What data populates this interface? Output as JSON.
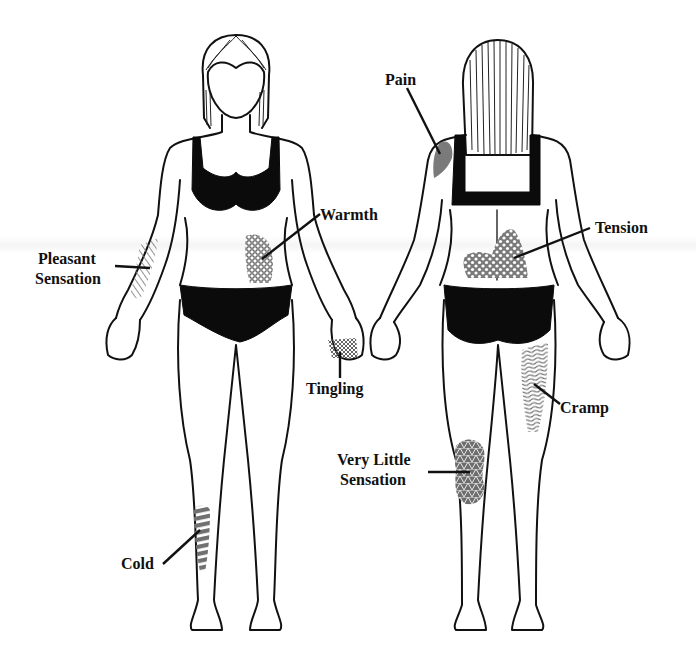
{
  "figure": {
    "views": [
      "front",
      "back"
    ],
    "labels": {
      "pleasant_line1": "Pleasant",
      "pleasant_line2": "Sensation",
      "warmth": "Warmth",
      "tingling": "Tingling",
      "cold": "Cold",
      "pain": "Pain",
      "tension": "Tension",
      "cramp": "Cramp",
      "very_little_line1": "Very Little",
      "very_little_line2": "Sensation"
    },
    "regions": [
      {
        "name": "pleasant-sensation",
        "view": "front",
        "location": "right forearm",
        "pattern": "diagonal-hatch"
      },
      {
        "name": "warmth",
        "view": "front",
        "location": "left abdomen",
        "pattern": "hexagon-dots"
      },
      {
        "name": "tingling",
        "view": "front",
        "location": "left hand fingers",
        "pattern": "cross-hatch"
      },
      {
        "name": "cold",
        "view": "front",
        "location": "right shin",
        "pattern": "horizontal-stripes"
      },
      {
        "name": "pain",
        "view": "back",
        "location": "left shoulder",
        "pattern": "solid-gray"
      },
      {
        "name": "tension",
        "view": "back",
        "location": "lower back",
        "pattern": "diamond-dots"
      },
      {
        "name": "cramp",
        "view": "back",
        "location": "right hamstring",
        "pattern": "wavy-lines"
      },
      {
        "name": "very-little-sensation",
        "view": "back",
        "location": "left back of knee",
        "pattern": "triangle-mesh"
      }
    ],
    "colors": {
      "ink": "#111111",
      "pattern_gray": "#6e6e6e",
      "background": "#ffffff"
    }
  }
}
